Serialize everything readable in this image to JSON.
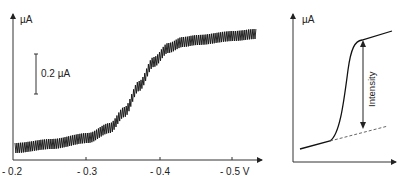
{
  "chart_data": [
    {
      "type": "line",
      "title": "",
      "xlabel": "V",
      "ylabel": "µA",
      "x_tick_labels": [
        "- 0.2",
        "- 0.3",
        "- 0.4",
        "- 0.5 V"
      ],
      "x_ticks": [
        -0.2,
        -0.3,
        -0.4,
        -0.5
      ],
      "xlim": [
        -0.2,
        -0.53
      ],
      "scale_bar_label": "0.2 µA",
      "scale_bar_value_uA": 0.2,
      "description": "Oscillating sigmoidal voltammetric wave (band with periodic noise) rising from baseline near -0.2 V to plateau past -0.42 V; half-wave near -0.37 V",
      "series": [
        {
          "name": "current",
          "x": [
            -0.2,
            -0.25,
            -0.3,
            -0.33,
            -0.35,
            -0.37,
            -0.39,
            -0.41,
            -0.43,
            -0.45,
            -0.5,
            -0.53
          ],
          "y_uA": [
            0.02,
            0.04,
            0.07,
            0.12,
            0.2,
            0.33,
            0.45,
            0.52,
            0.55,
            0.56,
            0.58,
            0.59
          ],
          "oscillation_amplitude_uA": 0.05
        }
      ],
      "grid": false,
      "legend": null
    },
    {
      "type": "line",
      "title": "",
      "ylabel": "µA",
      "xlabel": "",
      "annotation": "Intensity",
      "description": "Schematic sigmoid with dashed extrapolated baseline; double-headed arrow labelled Intensity between baseline and plateau",
      "series": [
        {
          "name": "curve",
          "points": [
            [
              0,
              0.08
            ],
            [
              0.3,
              0.15
            ],
            [
              0.6,
              0.95
            ],
            [
              1.0,
              1.0
            ]
          ]
        },
        {
          "name": "baseline-extrapolation",
          "style": "dashed",
          "points": [
            [
              0.3,
              0.15
            ],
            [
              0.93,
              0.28
            ]
          ]
        }
      ],
      "grid": false,
      "legend": null
    }
  ],
  "left_chart": {
    "y_axis_label": "µA",
    "scale_bar_label": "0.2 µA",
    "x_ticks": [
      "- 0.2",
      "- 0.3",
      "- 0.4",
      "- 0.5 V"
    ]
  },
  "right_chart": {
    "y_axis_label": "µA",
    "annotation": "Intensity"
  }
}
